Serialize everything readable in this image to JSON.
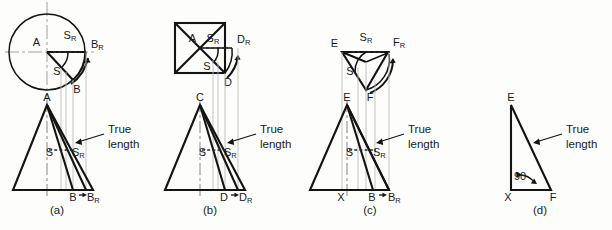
{
  "figure": {
    "background_color": "#fdfdfb",
    "line_color": "#141414",
    "projection_line_color": "#b9b9b9",
    "center_line_color": "#8f8f8f"
  },
  "panels": [
    {
      "id": "a",
      "caption": "(a)",
      "top_view": {
        "shape": "circle",
        "labels": [
          {
            "name": "A",
            "base": "A",
            "sub": ""
          },
          {
            "name": "S_R",
            "base": "S",
            "sub": "R"
          },
          {
            "name": "B_R",
            "base": "B",
            "sub": "R"
          },
          {
            "name": "S",
            "base": "S",
            "sub": ""
          },
          {
            "name": "B",
            "base": "B",
            "sub": ""
          }
        ]
      },
      "front_view": {
        "shape": "triangle",
        "labels": [
          {
            "name": "A",
            "base": "A",
            "sub": ""
          },
          {
            "name": "S",
            "base": "S",
            "sub": ""
          },
          {
            "name": "S_R",
            "base": "S",
            "sub": "R"
          },
          {
            "name": "B",
            "base": "B",
            "sub": ""
          },
          {
            "name": "B_R",
            "base": "B",
            "sub": "R"
          }
        ],
        "annotation": {
          "line1": "True",
          "line2": "length"
        }
      }
    },
    {
      "id": "b",
      "caption": "(b)",
      "top_view": {
        "shape": "square",
        "labels": [
          {
            "name": "A",
            "base": "A",
            "sub": ""
          },
          {
            "name": "S_R",
            "base": "S",
            "sub": "R"
          },
          {
            "name": "D_R",
            "base": "D",
            "sub": "R"
          },
          {
            "name": "S",
            "base": "S",
            "sub": ""
          },
          {
            "name": "D",
            "base": "D",
            "sub": ""
          }
        ]
      },
      "front_view": {
        "shape": "triangle",
        "labels": [
          {
            "name": "C",
            "base": "C",
            "sub": ""
          },
          {
            "name": "S",
            "base": "S",
            "sub": ""
          },
          {
            "name": "S_R",
            "base": "S",
            "sub": "R"
          },
          {
            "name": "D",
            "base": "D",
            "sub": ""
          },
          {
            "name": "D_R",
            "base": "D",
            "sub": "R"
          }
        ],
        "annotation": {
          "line1": "True",
          "line2": "length"
        }
      }
    },
    {
      "id": "c",
      "caption": "(c)",
      "top_view": {
        "shape": "triangle",
        "labels": [
          {
            "name": "E",
            "base": "E",
            "sub": ""
          },
          {
            "name": "S_R",
            "base": "S",
            "sub": "R"
          },
          {
            "name": "F_R",
            "base": "F",
            "sub": "R"
          },
          {
            "name": "S",
            "base": "S",
            "sub": ""
          },
          {
            "name": "F",
            "base": "F",
            "sub": ""
          }
        ]
      },
      "front_view": {
        "shape": "triangle",
        "labels": [
          {
            "name": "E",
            "base": "E",
            "sub": ""
          },
          {
            "name": "S",
            "base": "S",
            "sub": ""
          },
          {
            "name": "S_R",
            "base": "S",
            "sub": "R"
          },
          {
            "name": "X",
            "base": "X",
            "sub": ""
          },
          {
            "name": "B",
            "base": "B",
            "sub": ""
          },
          {
            "name": "B_R",
            "base": "B",
            "sub": "R"
          }
        ],
        "annotation": {
          "line1": "True",
          "line2": "length"
        }
      }
    },
    {
      "id": "d",
      "caption": "(d)",
      "front_view": {
        "shape": "right-triangle",
        "labels": [
          {
            "name": "E",
            "base": "E",
            "sub": ""
          },
          {
            "name": "X",
            "base": "X",
            "sub": ""
          },
          {
            "name": "F",
            "base": "F",
            "sub": ""
          }
        ],
        "angle_label": "90",
        "annotation": {
          "line1": "True",
          "line2": "length"
        }
      }
    }
  ]
}
